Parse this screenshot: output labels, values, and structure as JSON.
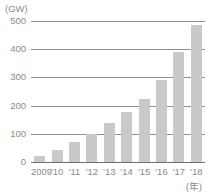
{
  "chart_data": {
    "type": "bar",
    "title": "",
    "subtitle": "",
    "xlabel": "(年)",
    "ylabel": "(GW)",
    "categories": [
      "2009",
      "'10",
      "'11",
      "'12",
      "'13",
      "'14",
      "'15",
      "'16",
      "'17",
      "'18"
    ],
    "values": [
      23,
      41,
      71,
      101,
      139,
      177,
      222,
      291,
      389,
      486
    ],
    "ylim": [
      0,
      500
    ],
    "yticks": [
      0,
      100,
      200,
      300,
      400,
      500
    ],
    "ytick_labels": [
      "0",
      "100",
      "200",
      "300",
      "400",
      "500"
    ],
    "grid": true,
    "grid_axis": "y",
    "legend": false,
    "legend_position": "none",
    "bar_color": "#c9c9c9",
    "gridline_color": "#8e8e8e",
    "axis_color": "#6f6f6f",
    "text_color": "#8a8a8a",
    "background_color": "#ffffff"
  }
}
